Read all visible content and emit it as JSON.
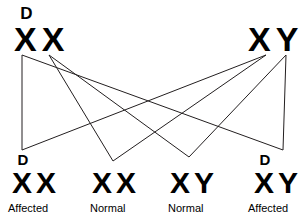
{
  "diagram": {
    "type": "genetic-cross-inheritance",
    "line_color": "#231f20",
    "text_color": "#000000",
    "background_color": "#ffffff",
    "parents": [
      {
        "id": "mother",
        "allele_1": "X",
        "allele_1_superscript": "D",
        "allele_2": "X",
        "allele_2_superscript": ""
      },
      {
        "id": "father",
        "allele_1": "X",
        "allele_1_superscript": "",
        "allele_2": "Y",
        "allele_2_superscript": ""
      }
    ],
    "offspring": [
      {
        "id": "child-1",
        "allele_1": "X",
        "allele_1_superscript": "D",
        "allele_2": "X",
        "allele_2_superscript": "",
        "phenotype": "Affected"
      },
      {
        "id": "child-2",
        "allele_1": "X",
        "allele_1_superscript": "",
        "allele_2": "X",
        "allele_2_superscript": "",
        "phenotype": "Normal"
      },
      {
        "id": "child-3",
        "allele_1": "X",
        "allele_1_superscript": "",
        "allele_2": "Y",
        "allele_2_superscript": "",
        "phenotype": "Normal"
      },
      {
        "id": "child-4",
        "allele_1": "X",
        "allele_1_superscript": "D",
        "allele_2": "Y",
        "allele_2_superscript": "",
        "phenotype": "Affected"
      }
    ],
    "connectors": [
      {
        "from": "mother-allele-1",
        "to": "child-1",
        "x1": 22,
        "y1": 55,
        "x2": 22,
        "y2": 150
      },
      {
        "from": "mother-allele-1",
        "to": "child-4",
        "x1": 22,
        "y1": 55,
        "x2": 283,
        "y2": 150
      },
      {
        "from": "mother-allele-2",
        "to": "child-2",
        "x1": 49,
        "y1": 55,
        "x2": 113,
        "y2": 161
      },
      {
        "from": "mother-allele-2",
        "to": "child-3",
        "x1": 49,
        "y1": 55,
        "x2": 189,
        "y2": 157
      },
      {
        "from": "father-allele-1",
        "to": "child-1",
        "x1": 266,
        "y1": 55,
        "x2": 22,
        "y2": 150
      },
      {
        "from": "father-allele-1",
        "to": "child-2",
        "x1": 266,
        "y1": 55,
        "x2": 113,
        "y2": 161
      },
      {
        "from": "father-allele-2",
        "to": "child-3",
        "x1": 286,
        "y1": 55,
        "x2": 189,
        "y2": 157
      },
      {
        "from": "father-allele-2",
        "to": "child-4",
        "x1": 286,
        "y1": 55,
        "x2": 283,
        "y2": 150
      }
    ]
  }
}
